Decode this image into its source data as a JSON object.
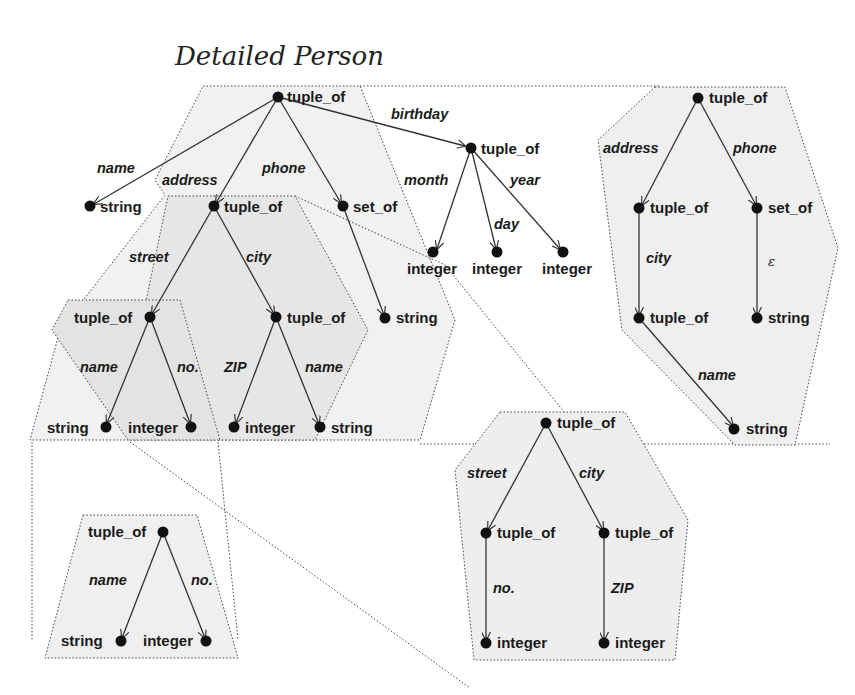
{
  "title": "Detailed Person",
  "colors": {
    "region_light": "#efefef",
    "region_dark": "#e0e0e0",
    "edge": "#333333",
    "node": "#111111"
  },
  "main_tree": {
    "nodes": [
      {
        "id": "root",
        "label": "tuple_of"
      },
      {
        "id": "name_str",
        "label": "string"
      },
      {
        "id": "addr",
        "label": "tuple_of"
      },
      {
        "id": "phone_set",
        "label": "set_of"
      },
      {
        "id": "bday",
        "label": "tuple_of"
      },
      {
        "id": "month_int",
        "label": "integer"
      },
      {
        "id": "day_int",
        "label": "integer"
      },
      {
        "id": "year_int",
        "label": "integer"
      },
      {
        "id": "street",
        "label": "tuple_of"
      },
      {
        "id": "city",
        "label": "tuple_of"
      },
      {
        "id": "phone_str",
        "label": "string"
      },
      {
        "id": "street_name",
        "label": "string"
      },
      {
        "id": "street_no",
        "label": "integer"
      },
      {
        "id": "city_zip",
        "label": "integer"
      },
      {
        "id": "city_name",
        "label": "string"
      }
    ],
    "edges": [
      {
        "from": "root",
        "to": "name_str",
        "label": "name"
      },
      {
        "from": "root",
        "to": "addr",
        "label": "address"
      },
      {
        "from": "root",
        "to": "phone_set",
        "label": "phone"
      },
      {
        "from": "root",
        "to": "bday",
        "label": "birthday"
      },
      {
        "from": "bday",
        "to": "month_int",
        "label": "month"
      },
      {
        "from": "bday",
        "to": "day_int",
        "label": "day"
      },
      {
        "from": "bday",
        "to": "year_int",
        "label": "year"
      },
      {
        "from": "addr",
        "to": "street",
        "label": "street"
      },
      {
        "from": "addr",
        "to": "city",
        "label": "city"
      },
      {
        "from": "phone_set",
        "to": "phone_str",
        "label": ""
      },
      {
        "from": "street",
        "to": "street_name",
        "label": "name"
      },
      {
        "from": "street",
        "to": "street_no",
        "label": "no."
      },
      {
        "from": "city",
        "to": "city_zip",
        "label": "ZIP"
      },
      {
        "from": "city",
        "to": "city_name",
        "label": "name"
      }
    ]
  },
  "right_tree": {
    "nodes": [
      {
        "id": "r_root",
        "label": "tuple_of"
      },
      {
        "id": "r_addr",
        "label": "tuple_of"
      },
      {
        "id": "r_phone",
        "label": "set_of"
      },
      {
        "id": "r_city",
        "label": "tuple_of"
      },
      {
        "id": "r_phone_str",
        "label": "string"
      },
      {
        "id": "r_name",
        "label": "string"
      }
    ],
    "edges": [
      {
        "from": "r_root",
        "to": "r_addr",
        "label": "address"
      },
      {
        "from": "r_root",
        "to": "r_phone",
        "label": "phone"
      },
      {
        "from": "r_addr",
        "to": "r_city",
        "label": "city"
      },
      {
        "from": "r_phone",
        "to": "r_phone_str",
        "label": "ε"
      },
      {
        "from": "r_city",
        "to": "r_name",
        "label": "name"
      }
    ]
  },
  "bottom_left_tree": {
    "nodes": [
      {
        "id": "bl_root",
        "label": "tuple_of"
      },
      {
        "id": "bl_name",
        "label": "string"
      },
      {
        "id": "bl_no",
        "label": "integer"
      }
    ],
    "edges": [
      {
        "from": "bl_root",
        "to": "bl_name",
        "label": "name"
      },
      {
        "from": "bl_root",
        "to": "bl_no",
        "label": "no."
      }
    ]
  },
  "bottom_right_tree": {
    "nodes": [
      {
        "id": "br_root",
        "label": "tuple_of"
      },
      {
        "id": "br_street",
        "label": "tuple_of"
      },
      {
        "id": "br_city",
        "label": "tuple_of"
      },
      {
        "id": "br_no",
        "label": "integer"
      },
      {
        "id": "br_zip",
        "label": "integer"
      }
    ],
    "edges": [
      {
        "from": "br_root",
        "to": "br_street",
        "label": "street"
      },
      {
        "from": "br_root",
        "to": "br_city",
        "label": "city"
      },
      {
        "from": "br_street",
        "to": "br_no",
        "label": "no."
      },
      {
        "from": "br_city",
        "to": "br_zip",
        "label": "ZIP"
      }
    ]
  }
}
